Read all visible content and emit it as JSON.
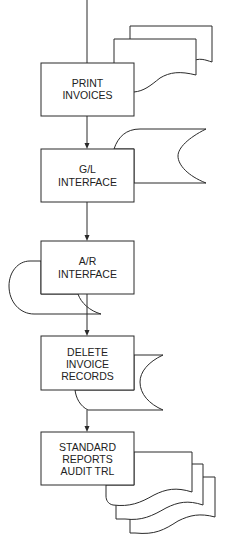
{
  "diagram": {
    "type": "flowchart",
    "line_color": "#2a2a2a",
    "background": "#ffffff",
    "steps": [
      {
        "id": "print-invoices",
        "lines": [
          "PRINT",
          "INVOICES"
        ],
        "output": "multiple-documents"
      },
      {
        "id": "gl-interface",
        "lines": [
          "G/L",
          "INTERFACE"
        ],
        "output": "stored-data"
      },
      {
        "id": "ar-interface",
        "lines": [
          "A/R",
          "INTERFACE"
        ],
        "output": "stored-data"
      },
      {
        "id": "delete-invoice-records",
        "lines": [
          "DELETE",
          "INVOICE",
          "RECORDS"
        ],
        "output": "stored-data"
      },
      {
        "id": "standard-reports",
        "lines": [
          "STANDARD",
          "REPORTS",
          "AUDIT TRL"
        ],
        "output": "multiple-documents"
      }
    ],
    "flow": [
      "print-invoices",
      "gl-interface",
      "ar-interface",
      "delete-invoice-records",
      "standard-reports"
    ]
  }
}
